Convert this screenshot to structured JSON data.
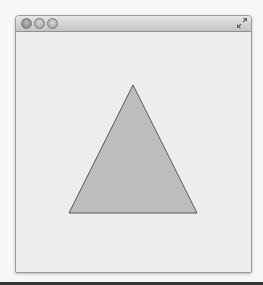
{
  "window": {
    "title": "",
    "buttons": [
      "close",
      "minimize",
      "zoom"
    ],
    "fullscreen_icon": "fullscreen-arrows-icon"
  },
  "canvas": {
    "shape": "triangle",
    "points": [
      [
        133,
        85
      ],
      [
        69,
        213
      ],
      [
        197,
        213
      ]
    ],
    "fill": "#bdbdbd",
    "stroke": "#555555",
    "background": "#ededed"
  }
}
